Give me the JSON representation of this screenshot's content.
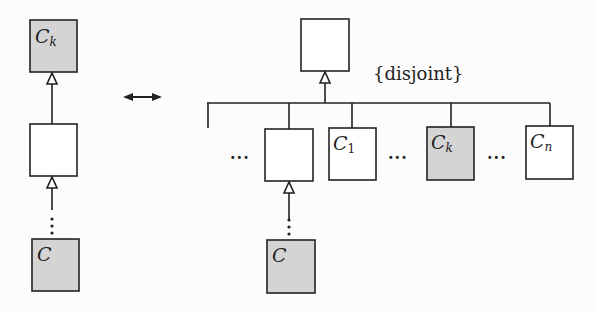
{
  "diagram": {
    "left": {
      "top_class": {
        "name": "C",
        "sub": "k",
        "shaded": true
      },
      "middle_class": {
        "name": "",
        "shaded": false
      },
      "bottom_class": {
        "name": "C",
        "shaded": true
      }
    },
    "equivalence_arrow": "↔",
    "right": {
      "parent_class": {
        "name": ""
      },
      "constraint": "{disjoint}",
      "ellipsis": "...",
      "children": [
        {
          "name": "",
          "shaded": false
        },
        {
          "name": "C",
          "sub": "1",
          "shaded": false
        },
        {
          "name": "C",
          "sub": "k",
          "shaded": true
        },
        {
          "name": "C",
          "sub": "n",
          "shaded": false
        }
      ],
      "bottom_class": {
        "name": "C",
        "shaded": true
      }
    },
    "colors": {
      "shaded_fill": "#d4d4d4",
      "stroke": "#222222",
      "background": "#fcfcfc"
    }
  }
}
